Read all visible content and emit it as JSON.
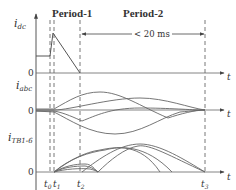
{
  "title_period1": "Period-1",
  "title_period2": "Period-2",
  "duration_label": "< 20 ms",
  "axes": {
    "dc": {
      "ylabel": "i",
      "ylabel_sub": "dc",
      "zero": "0",
      "xlabel": "t"
    },
    "abc": {
      "ylabel": "i",
      "ylabel_sub": "abc",
      "zero": "0",
      "xlabel": "t"
    },
    "tb": {
      "ylabel": "i",
      "ylabel_sub": "TB1-6",
      "zero": "0",
      "xlabel": "t"
    }
  },
  "time_markers": [
    {
      "label": "t",
      "sub": "0"
    },
    {
      "label": "t",
      "sub": "1"
    },
    {
      "label": "t",
      "sub": "2"
    },
    {
      "label": "t",
      "sub": "3"
    }
  ],
  "colors": {
    "line": "#555555",
    "axis": "#444444",
    "text": "#333333"
  }
}
